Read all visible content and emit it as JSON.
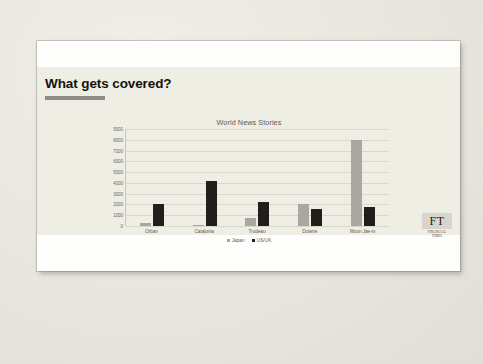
{
  "slide": {
    "title": "What gets covered?",
    "brand": {
      "mark": "FT",
      "wordmark_line1": "FINANCIAL",
      "wordmark_line2": "TIMES"
    }
  },
  "colors": {
    "slide_body": "#efeee4",
    "slide_band": "#fefefc",
    "title_text": "#14120f",
    "title_rule": "#8e8c85",
    "series_japan": "#a9a8a0",
    "series_usuk": "#211f1b",
    "gridline": "#d9d7cd",
    "axis": "#c9c7bd",
    "label_text": "#5e5c55",
    "ft_mark_bg": "#d8d6cc"
  },
  "chart_data": {
    "type": "bar",
    "title": "World News Stories",
    "xlabel": "",
    "ylabel": "",
    "ylim": [
      0,
      9000
    ],
    "ytick_step": 1000,
    "yticks": [
      0,
      1000,
      2000,
      3000,
      4000,
      5000,
      6000,
      7000,
      8000,
      9000
    ],
    "grid": true,
    "legend_position": "bottom",
    "categories": [
      "Orban",
      "Catalonia",
      "Trudeau",
      "Duterte",
      "Moon Jae-in"
    ],
    "series": [
      {
        "name": "Japan",
        "color": "#a9a8a0",
        "values": [
          250,
          100,
          700,
          2050,
          8000
        ]
      },
      {
        "name": "US/UK",
        "color": "#211f1b",
        "values": [
          2000,
          4200,
          2250,
          1600,
          1800
        ]
      }
    ]
  }
}
